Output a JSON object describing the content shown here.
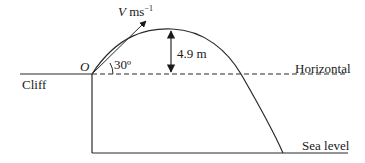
{
  "diagram": {
    "labels": {
      "velocity_symbol": "V",
      "velocity_unit": "ms",
      "velocity_exponent": "−1",
      "origin": "O",
      "angle": "30º",
      "height": "4.9 m",
      "horizontal": "Horizontal",
      "cliff": "Cliff",
      "sea_level": "Sea level"
    },
    "colors": {
      "line": "#2a2a2a",
      "background": "#ffffff"
    }
  }
}
